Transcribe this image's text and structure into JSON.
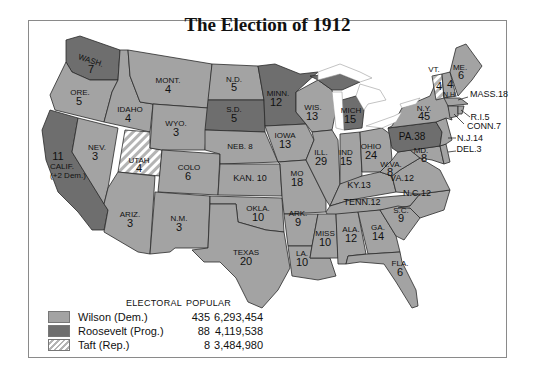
{
  "title": "The Election of 1912",
  "colors": {
    "wilson": "#a3a3a3",
    "roosevelt": "#6e6e6e",
    "taft_hatch_bg": "#ffffff",
    "taft_hatch_line": "#b4b4b4",
    "border": "#2a2a2a",
    "water": "#ffffff"
  },
  "legend": {
    "header_electoral": "ELECTORAL",
    "header_popular": "POPULAR",
    "rows": [
      {
        "candidate": "Wilson (Dem.)",
        "electoral": "435",
        "popular": "6,293,454",
        "fill": "wilson"
      },
      {
        "candidate": "Roosevelt (Prog.)",
        "electoral": "88",
        "popular": "4,119,538",
        "fill": "roosevelt"
      },
      {
        "candidate": "Taft (Rep.)",
        "electoral": "8",
        "popular": "3,484,980",
        "fill": "taft"
      }
    ]
  },
  "states": [
    {
      "abbr": "WASH.",
      "votes": "7",
      "winner": "roosevelt"
    },
    {
      "abbr": "ORE.",
      "votes": "5",
      "winner": "wilson"
    },
    {
      "abbr": "CALIF.",
      "votes": "11",
      "note": "(+2 Dem.)",
      "winner": "roosevelt"
    },
    {
      "abbr": "IDAHO",
      "votes": "4",
      "winner": "wilson"
    },
    {
      "abbr": "NEV.",
      "votes": "3",
      "winner": "wilson"
    },
    {
      "abbr": "UTAH",
      "votes": "4",
      "winner": "taft"
    },
    {
      "abbr": "ARIZ.",
      "votes": "3",
      "winner": "wilson"
    },
    {
      "abbr": "MONT.",
      "votes": "4",
      "winner": "wilson"
    },
    {
      "abbr": "WYO.",
      "votes": "3",
      "winner": "wilson"
    },
    {
      "abbr": "COLO",
      "votes": "6",
      "winner": "wilson"
    },
    {
      "abbr": "N.M.",
      "votes": "3",
      "winner": "wilson"
    },
    {
      "abbr": "N.D.",
      "votes": "5",
      "winner": "wilson"
    },
    {
      "abbr": "S.D.",
      "votes": "5",
      "winner": "roosevelt"
    },
    {
      "abbr": "NEB.",
      "votes": "8",
      "winner": "wilson"
    },
    {
      "abbr": "KAN.",
      "votes": "10",
      "winner": "wilson"
    },
    {
      "abbr": "OKLA.",
      "votes": "10",
      "winner": "wilson"
    },
    {
      "abbr": "TEXAS",
      "votes": "20",
      "winner": "wilson"
    },
    {
      "abbr": "MINN.",
      "votes": "12",
      "winner": "roosevelt"
    },
    {
      "abbr": "IOWA",
      "votes": "13",
      "winner": "wilson"
    },
    {
      "abbr": "MO",
      "votes": "18",
      "winner": "wilson"
    },
    {
      "abbr": "ARK.",
      "votes": "9",
      "winner": "wilson"
    },
    {
      "abbr": "LA.",
      "votes": "10",
      "winner": "wilson"
    },
    {
      "abbr": "WIS.",
      "votes": "13",
      "winner": "wilson"
    },
    {
      "abbr": "ILL.",
      "votes": "29",
      "winner": "wilson"
    },
    {
      "abbr": "MICH",
      "votes": "15",
      "winner": "roosevelt"
    },
    {
      "abbr": "IND",
      "votes": "15",
      "winner": "wilson"
    },
    {
      "abbr": "OHIO",
      "votes": "24",
      "winner": "wilson"
    },
    {
      "abbr": "KY.",
      "votes": "13",
      "winner": "wilson"
    },
    {
      "abbr": "TENN.",
      "votes": "12",
      "winner": "wilson"
    },
    {
      "abbr": "MISS",
      "votes": "10",
      "winner": "wilson"
    },
    {
      "abbr": "ALA.",
      "votes": "12",
      "winner": "wilson"
    },
    {
      "abbr": "GA.",
      "votes": "14",
      "winner": "wilson"
    },
    {
      "abbr": "FLA.",
      "votes": "6",
      "winner": "wilson"
    },
    {
      "abbr": "S.C.",
      "votes": "9",
      "winner": "wilson"
    },
    {
      "abbr": "N.C.",
      "votes": "12",
      "winner": "wilson"
    },
    {
      "abbr": "VA.",
      "votes": "12",
      "winner": "wilson"
    },
    {
      "abbr": "W.VA.",
      "votes": "8",
      "winner": "wilson"
    },
    {
      "abbr": "MD.",
      "votes": "8",
      "winner": "wilson"
    },
    {
      "abbr": "DEL.",
      "votes": "3",
      "winner": "wilson"
    },
    {
      "abbr": "PA.",
      "votes": "38",
      "winner": "roosevelt"
    },
    {
      "abbr": "N.J.",
      "votes": "14",
      "winner": "wilson"
    },
    {
      "abbr": "N.Y.",
      "votes": "45",
      "winner": "wilson"
    },
    {
      "abbr": "VT.",
      "votes": "4",
      "winner": "taft"
    },
    {
      "abbr": "N.H.",
      "votes": "4",
      "winner": "wilson"
    },
    {
      "abbr": "ME.",
      "votes": "6",
      "winner": "wilson"
    },
    {
      "abbr": "MASS.",
      "votes": "18",
      "winner": "wilson"
    },
    {
      "abbr": "R.I.",
      "votes": "5",
      "winner": "wilson"
    },
    {
      "abbr": "CONN.",
      "votes": "7",
      "winner": "wilson"
    }
  ],
  "labels": {
    "wash": "WASH.",
    "wash_n": "7",
    "ore": "ORE.",
    "ore_n": "5",
    "calif": "CALIF.",
    "calif_n": "11",
    "calif_note": "(+2 Dem.)",
    "idaho": "IDAHO",
    "idaho_n": "4",
    "nev": "NEV.",
    "nev_n": "3",
    "utah": "UTAH",
    "utah_n": "4",
    "ariz": "ARIZ.",
    "ariz_n": "3",
    "mont": "MONT.",
    "mont_n": "4",
    "wyo": "WYO.",
    "wyo_n": "3",
    "colo": "COLO",
    "colo_n": "6",
    "nm": "N.M.",
    "nm_n": "3",
    "nd": "N.D.",
    "nd_n": "5",
    "sd": "S.D.",
    "sd_n": "5",
    "neb": "NEB. 8",
    "kan": "KAN. 10",
    "okla": "OKLA.",
    "okla_n": "10",
    "texas": "TEXAS",
    "texas_n": "20",
    "minn": "MINN.",
    "minn_n": "12",
    "iowa": "IOWA",
    "iowa_n": "13",
    "mo": "MO",
    "mo_n": "18",
    "ark": "ARK.",
    "ark_n": "9",
    "la": "LA.",
    "la_n": "10",
    "wis": "WIS.",
    "wis_n": "13",
    "ill": "ILL.",
    "ill_n": "29",
    "mich": "MICH",
    "mich_n": "15",
    "ind": "IND",
    "ind_n": "15",
    "ohio": "OHIO",
    "ohio_n": "24",
    "ky": "KY.13",
    "tenn": "TENN.12",
    "miss": "MISS",
    "miss_n": "10",
    "ala": "ALA.",
    "ala_n": "12",
    "ga": "GA.",
    "ga_n": "14",
    "fla": "FLA.",
    "fla_n": "6",
    "sc": "S.C.",
    "sc_n": "9",
    "nc": "N.C.12",
    "va": "VA.12",
    "wva": "W.VA.",
    "wva_n": "8",
    "md": "MD.",
    "md_n": "8",
    "del": "DEL.3",
    "pa": "PA.38",
    "nj": "N.J.14",
    "ny": "N.Y.",
    "ny_n": "45",
    "vt": "VT.",
    "vt_n": "4",
    "nh": "N.H.",
    "nh_n": "4",
    "me": "ME.",
    "me_n": "6",
    "mass": "MASS.18",
    "ri": "R.I.5",
    "conn": "CONN.7"
  }
}
